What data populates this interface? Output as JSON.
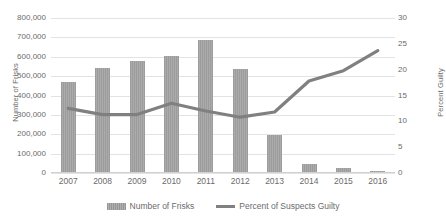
{
  "chart_data": {
    "type": "bar",
    "title": "",
    "subtitle": "",
    "xlabel": "",
    "ylabel": "Number of Frisks",
    "y2label": "Percent Guilty",
    "categories": [
      "2007",
      "2008",
      "2009",
      "2010",
      "2011",
      "2012",
      "2013",
      "2014",
      "2015",
      "2016"
    ],
    "ylim": [
      0,
      800000
    ],
    "y2lim": [
      0,
      30
    ],
    "y_ticks": [
      "0",
      "100,000",
      "200,000",
      "300,000",
      "400,000",
      "500,000",
      "600,000",
      "700,000",
      "800,000"
    ],
    "y_tick_values": [
      0,
      100000,
      200000,
      300000,
      400000,
      500000,
      600000,
      700000,
      800000
    ],
    "y2_ticks": [
      "0",
      "5",
      "10",
      "15",
      "20",
      "25",
      "30"
    ],
    "y2_tick_values": [
      0,
      5,
      10,
      15,
      20,
      25,
      30
    ],
    "grid": true,
    "legend_position": "bottom",
    "series": [
      {
        "name": "Number of Frisks",
        "type": "bar",
        "axis": "left",
        "color": "#a6a6a6",
        "values": [
          470000,
          540000,
          578000,
          602000,
          685000,
          538000,
          197000,
          48000,
          24000,
          12000
        ]
      },
      {
        "name": "Percent of Suspects Guilty",
        "type": "line",
        "axis": "right",
        "color": "#808080",
        "values": [
          12.5,
          11.3,
          11.3,
          13.5,
          12.0,
          10.8,
          11.8,
          17.8,
          19.8,
          23.7
        ]
      }
    ]
  },
  "legend": {
    "items": [
      {
        "label": "Number of Frisks",
        "marker": "bar-swatch-icon"
      },
      {
        "label": "Percent of Suspects Guilty",
        "marker": "line-swatch-icon"
      }
    ]
  }
}
